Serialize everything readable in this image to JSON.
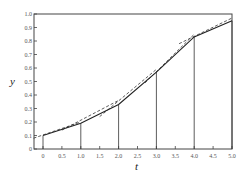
{
  "chart_data": {
    "type": "line",
    "title": "",
    "xlabel": "t",
    "ylabel": "y",
    "xlim": [
      -0.25,
      5.0
    ],
    "ylim": [
      0,
      1.0
    ],
    "x_ticks": [
      "0",
      "0.5",
      "1.0",
      "1.5",
      "2.0",
      "2.5",
      "3.0",
      "3.5",
      "4.0",
      "4.5",
      "5.0"
    ],
    "y_ticks": [
      "0",
      "0.1",
      "0.2",
      "0.3",
      "0.4",
      "0.5",
      "0.6",
      "0.7",
      "0.8",
      "0.9",
      "1.0"
    ],
    "grid": false,
    "legend": null,
    "series": [
      {
        "name": "piecewise solution (solid)",
        "style": "solid",
        "x": [
          0,
          1.0,
          2.0,
          3.0,
          4.0,
          5.0
        ],
        "y": [
          0.1,
          0.19,
          0.33,
          0.57,
          0.83,
          0.95
        ]
      },
      {
        "name": "tangent segments (dashed)",
        "style": "dashed",
        "segments": [
          {
            "x": [
              -0.25,
              1.0
            ],
            "y": [
              0.08,
              0.2
            ]
          },
          {
            "x": [
              0.5,
              2.0
            ],
            "y": [
              0.14,
              0.36
            ]
          },
          {
            "x": [
              1.5,
              3.0
            ],
            "y": [
              0.24,
              0.59
            ]
          },
          {
            "x": [
              2.7,
              4.0
            ],
            "y": [
              0.49,
              0.85
            ]
          },
          {
            "x": [
              3.6,
              5.0
            ],
            "y": [
              0.78,
              0.97
            ]
          }
        ]
      }
    ],
    "vertical_lines": {
      "x": [
        0,
        1.0,
        2.0,
        3.0,
        4.0,
        5.0
      ],
      "y_top": [
        0.1,
        0.19,
        0.33,
        0.57,
        0.83,
        0.95
      ]
    }
  }
}
